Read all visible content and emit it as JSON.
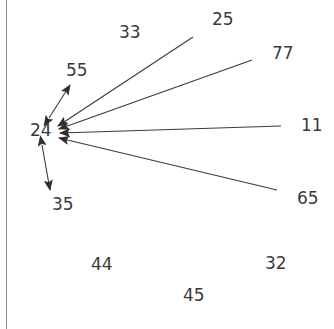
{
  "figure": {
    "type": "directed-graph",
    "background_color": "#ffffff",
    "edge_color": "#3a3a3a",
    "label_color": "#3a3a3a",
    "border_color": "#8a8a8a",
    "width": 334,
    "height": 329
  },
  "nodes": [
    {
      "id": "24",
      "label": "24",
      "x": 30,
      "y": 131,
      "anchor_x": 58,
      "anchor_y": 131,
      "isolated": false
    },
    {
      "id": "55",
      "label": "55",
      "x": 66,
      "y": 71,
      "anchor_x": 71,
      "anchor_y": 84,
      "isolated": false
    },
    {
      "id": "35",
      "label": "35",
      "x": 52,
      "y": 205,
      "anchor_x": 48,
      "anchor_y": 188,
      "isolated": false
    },
    {
      "id": "25",
      "label": "25",
      "x": 212,
      "y": 20,
      "anchor_x": 195,
      "anchor_y": 35,
      "isolated": false
    },
    {
      "id": "77",
      "label": "77",
      "x": 272,
      "y": 54,
      "anchor_x": 255,
      "anchor_y": 58,
      "isolated": false
    },
    {
      "id": "11",
      "label": "11",
      "x": 301,
      "y": 126,
      "anchor_x": 283,
      "anchor_y": 126,
      "isolated": false
    },
    {
      "id": "65",
      "label": "65",
      "x": 297,
      "y": 199,
      "anchor_x": 280,
      "anchor_y": 191,
      "isolated": false
    },
    {
      "id": "33",
      "label": "33",
      "x": 119,
      "y": 33,
      "anchor_x": 119,
      "anchor_y": 33,
      "isolated": true
    },
    {
      "id": "44",
      "label": "44",
      "x": 91,
      "y": 265,
      "anchor_x": 91,
      "anchor_y": 265,
      "isolated": true
    },
    {
      "id": "45",
      "label": "45",
      "x": 183,
      "y": 296,
      "anchor_x": 183,
      "anchor_y": 296,
      "isolated": true
    },
    {
      "id": "32",
      "label": "32",
      "x": 265,
      "y": 264,
      "anchor_x": 265,
      "anchor_y": 264,
      "isolated": true
    }
  ],
  "edges": [
    {
      "from": "25",
      "to": "24",
      "direction": "one-way",
      "x1": 193,
      "y1": 37,
      "x2": 58,
      "y2": 126
    },
    {
      "from": "77",
      "to": "24",
      "direction": "one-way",
      "x1": 252,
      "y1": 60,
      "x2": 59,
      "y2": 129
    },
    {
      "from": "11",
      "to": "24",
      "direction": "one-way",
      "x1": 281,
      "y1": 126,
      "x2": 60,
      "y2": 133
    },
    {
      "from": "65",
      "to": "24",
      "direction": "one-way",
      "x1": 277,
      "y1": 190,
      "x2": 59,
      "y2": 138
    },
    {
      "from": "24",
      "to": "55",
      "direction": "two-way",
      "x1": 49,
      "y1": 118,
      "x2": 70,
      "y2": 85
    },
    {
      "from": "24",
      "to": "35",
      "direction": "two-way",
      "x1": 42,
      "y1": 145,
      "x2": 50,
      "y2": 190
    }
  ]
}
